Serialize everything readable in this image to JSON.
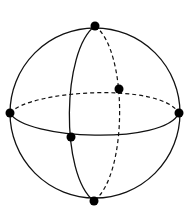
{
  "diagram": {
    "sphere": {
      "cx": 95,
      "cy": 113,
      "r": 85
    },
    "stroke_color": "#111111",
    "points": [
      {
        "name": "top",
        "x": 95,
        "y": 26
      },
      {
        "name": "bottom",
        "x": 94,
        "y": 201
      },
      {
        "name": "left",
        "x": 10,
        "y": 113
      },
      {
        "name": "right",
        "x": 179,
        "y": 113
      },
      {
        "name": "front",
        "x": 71,
        "y": 137
      },
      {
        "name": "back",
        "x": 119,
        "y": 89
      }
    ]
  }
}
